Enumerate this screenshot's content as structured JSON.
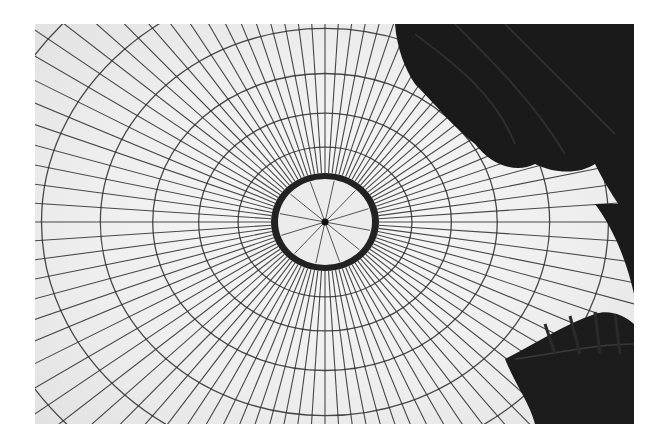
{
  "image": {
    "subject": "Glass dome ceiling viewed from below with radial iron ribs and fern fronds",
    "style": "black-and-white photograph",
    "colors": {
      "background": "#ffffff",
      "glass": "#efefef",
      "frame": "#2a2a2a",
      "foliage": "#141414"
    },
    "oculus": {
      "cx": 290,
      "cy": 198,
      "rx": 54,
      "ry": 49
    },
    "radial_ribs": 96,
    "concentric_rings": 11
  }
}
